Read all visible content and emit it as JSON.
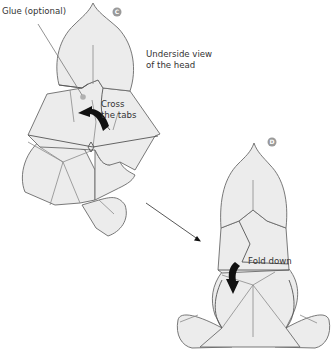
{
  "steps": [
    {
      "id": "C",
      "badge": "C",
      "caption_line1": "Underside view",
      "caption_line2": "of the head",
      "glue_label": "Glue (optional)",
      "action_line1": "Cross",
      "action_line2": "the tabs"
    },
    {
      "id": "D",
      "badge": "D",
      "action_label": "Fold down"
    }
  ],
  "colors": {
    "paper_fill": "#ececec",
    "outline": "#6a6a6a",
    "badge": "#9a9a9a",
    "arrow": "#111111",
    "glue_dot": "#b0b0b0"
  }
}
